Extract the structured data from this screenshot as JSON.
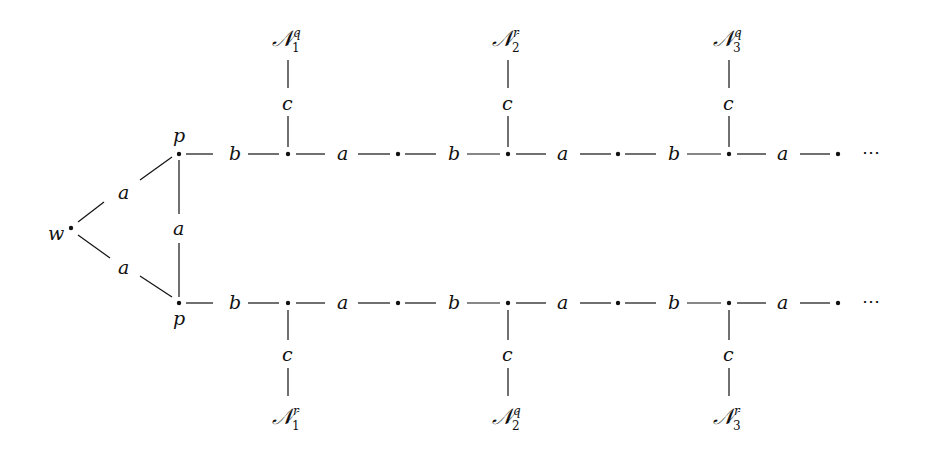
{
  "diagram": {
    "type": "graph",
    "root": {
      "label": "w"
    },
    "branch_nodes": {
      "top": "p",
      "bottom": "p"
    },
    "edges_from_root": [
      "a",
      "a"
    ],
    "vertical_edge_between_p": "a",
    "chain_edge_pattern": [
      "b",
      "a",
      "b",
      "a",
      "b",
      "a"
    ],
    "spur_edge_label": "c",
    "continuation": "⋯",
    "top_row": {
      "labels": [
        "b",
        "a",
        "b",
        "a",
        "b",
        "a"
      ],
      "spurs": [
        {
          "edge": "c",
          "N": "𝒩",
          "sub": "1",
          "sup": "q"
        },
        {
          "edge": "c",
          "N": "𝒩",
          "sub": "2",
          "sup": "r"
        },
        {
          "edge": "c",
          "N": "𝒩",
          "sub": "3",
          "sup": "q"
        }
      ]
    },
    "bottom_row": {
      "labels": [
        "b",
        "a",
        "b",
        "a",
        "b",
        "a"
      ],
      "spurs": [
        {
          "edge": "c",
          "N": "𝒩",
          "sub": "1",
          "sup": "r"
        },
        {
          "edge": "c",
          "N": "𝒩",
          "sub": "2",
          "sup": "q"
        },
        {
          "edge": "c",
          "N": "𝒩",
          "sub": "3",
          "sup": "r"
        }
      ]
    }
  }
}
